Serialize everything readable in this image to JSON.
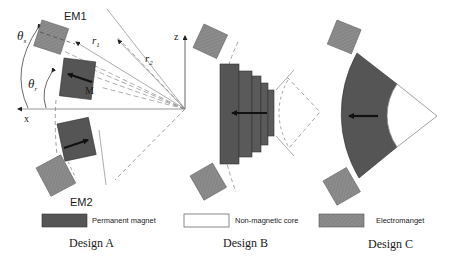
{
  "colors": {
    "permanent_magnet": "#5a5a5a",
    "electromagnet": "#8a8a8a",
    "non_magnetic_core": "#ffffff",
    "line": "#7a7a7a",
    "arrow": "#111111"
  },
  "design_a": {
    "em1_label": "EM1",
    "em2_label": "EM2",
    "theta_s_label": "θs",
    "theta_r_label": "θr",
    "r1_label": "r1",
    "r2_label": "r2",
    "m_label": "M",
    "x_axis_label": "x",
    "z_axis_label": "z",
    "caption": "Design A"
  },
  "design_b": {
    "caption": "Design B"
  },
  "design_c": {
    "caption": "Design C"
  },
  "legend": {
    "items": [
      {
        "label": "Permanent magnet",
        "swatch": "permanent-magnet"
      },
      {
        "label": "Non-magnetic core",
        "swatch": "non-magnetic-core"
      },
      {
        "label": "Electromanget",
        "swatch": "electromagnet"
      }
    ]
  }
}
